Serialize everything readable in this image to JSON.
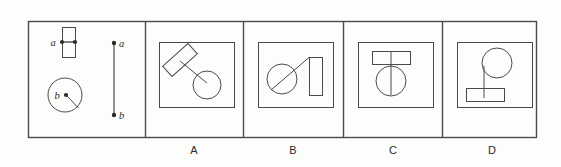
{
  "figure": {
    "type": "mental-rotation-multiple-choice",
    "background_color": "#fdfdfc",
    "stroke_color": "#4a4a4a",
    "label_color": "#2b2b2b",
    "frame": {
      "x": 28,
      "y": 21,
      "width": 509,
      "height": 117
    },
    "dividers_x": [
      145,
      243,
      343,
      442
    ],
    "reference_panel": {
      "name": "reference",
      "sub_figures": [
        {
          "name": "object-a",
          "shape": "rectangle",
          "label": "a",
          "label_x": 53,
          "label_y": 42,
          "rect": {
            "x": 62,
            "y": 27,
            "width": 13,
            "height": 30
          },
          "markers": [
            {
              "name": "dot-a-left",
              "cx": 62,
              "cy": 42,
              "r": 2
            },
            {
              "name": "dot-a-right",
              "cx": 74,
              "cy": 42,
              "r": 2
            }
          ],
          "connector": {
            "x1": 62,
            "y1": 42,
            "x2": 74,
            "y2": 42
          }
        },
        {
          "name": "object-b",
          "shape": "circle",
          "label": "b",
          "label_x": 57,
          "label_y": 95,
          "circle": {
            "cx": 65,
            "cy": 95,
            "r": 17
          },
          "markers": [
            {
              "name": "dot-b-center",
              "cx": 66,
              "cy": 95,
              "r": 2
            }
          ],
          "radius_line": {
            "x1": 66,
            "y1": 95,
            "x2": 78,
            "y2": 108
          }
        },
        {
          "name": "axis-segment",
          "shape": "vertical-line",
          "line": {
            "x1": 114,
            "y1": 43,
            "x2": 114,
            "y2": 115
          },
          "endpoints": [
            {
              "name": "endpoint-a",
              "label": "a",
              "cx": 114,
              "cy": 43,
              "r": 2,
              "label_x": 120,
              "label_y": 43
            },
            {
              "name": "endpoint-b",
              "label": "b",
              "cx": 114,
              "cy": 115,
              "r": 2,
              "label_x": 120,
              "label_y": 115
            }
          ]
        }
      ]
    },
    "options": [
      {
        "name": "option-a",
        "label": "A",
        "inner_box": {
          "x": 159,
          "y": 42,
          "width": 75,
          "height": 65
        },
        "description": "tilted rectangle upper-left joined by a diagonal line to a circle at lower-right",
        "elements": [
          {
            "type": "rotated-rect",
            "cx": 180,
            "cy": 60,
            "width": 34,
            "height": 14,
            "rotation": -42
          },
          {
            "type": "line",
            "x1": 180,
            "y1": 60,
            "x2": 207,
            "y2": 83
          },
          {
            "type": "circle",
            "cx": 207,
            "cy": 85,
            "r": 14
          }
        ]
      },
      {
        "name": "option-b",
        "label": "B",
        "inner_box": {
          "x": 258,
          "y": 42,
          "width": 75,
          "height": 65
        },
        "description": "circle at left crossed by a diagonal line running up-right to the top-left corner of an upright rectangle",
        "elements": [
          {
            "type": "circle",
            "cx": 282,
            "cy": 79,
            "r": 15
          },
          {
            "type": "line",
            "x1": 271,
            "y1": 90,
            "x2": 309,
            "y2": 57
          },
          {
            "type": "rect",
            "x": 309,
            "y": 57,
            "width": 13,
            "height": 38
          }
        ]
      },
      {
        "name": "option-c",
        "label": "C",
        "inner_box": {
          "x": 358,
          "y": 42,
          "width": 75,
          "height": 65
        },
        "description": "horizontal rectangle at top with a vertical line descending through the centre of a circle below",
        "elements": [
          {
            "type": "rect",
            "x": 372,
            "y": 51,
            "width": 38,
            "height": 13
          },
          {
            "type": "line",
            "x1": 391,
            "y1": 57,
            "x2": 391,
            "y2": 95
          },
          {
            "type": "circle",
            "cx": 391,
            "cy": 81,
            "r": 15
          }
        ]
      },
      {
        "name": "option-d",
        "label": "D",
        "inner_box": {
          "x": 457,
          "y": 42,
          "width": 75,
          "height": 65
        },
        "description": "circle at upper-right with a vertical line from its left edge descending to a horizontal rectangle below",
        "elements": [
          {
            "type": "circle",
            "cx": 497,
            "cy": 63,
            "r": 15
          },
          {
            "type": "line",
            "x1": 484,
            "y1": 70,
            "x2": 484,
            "y2": 97
          },
          {
            "type": "rect",
            "x": 466,
            "y": 88,
            "width": 38,
            "height": 13
          }
        ]
      }
    ]
  }
}
